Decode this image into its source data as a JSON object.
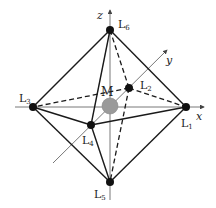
{
  "diagram": {
    "center": {
      "label": "M",
      "x": 110,
      "y": 106,
      "r": 8,
      "color": "#9a9a9a"
    },
    "ligands": [
      {
        "id": "L1",
        "base": "L",
        "sub": "1",
        "x": 186,
        "y": 107,
        "lx": 181,
        "ly": 127
      },
      {
        "id": "L2",
        "base": "L",
        "sub": "2",
        "x": 129,
        "y": 88,
        "lx": 140,
        "ly": 89
      },
      {
        "id": "L3",
        "base": "L",
        "sub": "3",
        "x": 33,
        "y": 107,
        "lx": 19,
        "ly": 102
      },
      {
        "id": "L4",
        "base": "L",
        "sub": "4",
        "x": 91,
        "y": 125,
        "lx": 82,
        "ly": 144
      },
      {
        "id": "L5",
        "base": "L",
        "sub": "5",
        "x": 110,
        "y": 182,
        "lx": 94,
        "ly": 198
      },
      {
        "id": "L6",
        "base": "L",
        "sub": "6",
        "x": 110,
        "y": 30,
        "lx": 118,
        "ly": 28
      }
    ],
    "axes": {
      "x": {
        "label": "x",
        "x1": 15,
        "y1": 107,
        "x2": 204,
        "y2": 107,
        "lx": 196,
        "ly": 120
      },
      "y": {
        "label": "y",
        "x1": 53,
        "y1": 163,
        "x2": 167,
        "y2": 50,
        "lx": 166,
        "ly": 64
      },
      "z": {
        "label": "z",
        "x1": 110,
        "y1": 200,
        "x2": 110,
        "y2": 10,
        "lx": 97,
        "ly": 19
      }
    },
    "center_label": {
      "text": "M",
      "x": 101,
      "y": 96
    },
    "colors": {
      "line": "#1a1a1a",
      "axis": "#555555",
      "node": "#111111"
    }
  }
}
